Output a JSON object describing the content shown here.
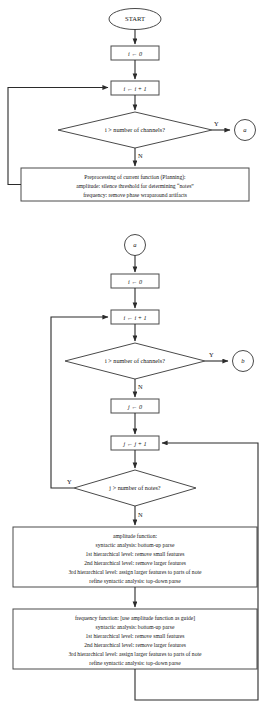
{
  "diagram": {
    "nodes": {
      "start": "START",
      "init_i": "i ← 0",
      "incr_i": "i ← i + 1",
      "decision_channels_1": "i > number of channels?",
      "connector_a_out": "a",
      "connector_a_in": "a",
      "preprocess": {
        "line1": "Preprocessing of current function (Planning):",
        "line2": "amplitude: silence threshold for determining “notes”",
        "line3": "frequency: remove phase wraparound artifacts"
      },
      "init_i2": "i ← 0",
      "incr_i2": "i ← i + 1",
      "decision_channels_2": "i > number of channels?",
      "connector_b": "b",
      "init_j": "j ← 0",
      "incr_j": "j ← j + 1",
      "decision_notes": "j > number of notes?",
      "amplitude_box": {
        "line1": "amplitude function:",
        "line2": "syntactic analysis: bottom-up parse",
        "line3": "1st hierarchical level: remove small features",
        "line4": "2nd hierarchical level: remove larger features",
        "line5": "3rd hierarchical level: assign larger features to parts of note",
        "line6": "refine syntactic analysis: top-down parse"
      },
      "frequency_box": {
        "line1": "frequency function: [use amplitude function as guide]",
        "line2": "syntactic analysis: bottom-up parse",
        "line3": "1st hierarchical level: remove small features",
        "line4": "2nd hierarchical level: remove larger features",
        "line5": "3rd hierarchical level: assign larger features to parts of note",
        "line6": "refine syntactic analysis: top-down parse"
      }
    },
    "edge_labels": {
      "yes_1": "Y",
      "no_1": "N",
      "yes_2": "Y",
      "no_2": "N",
      "yes_3": "Y",
      "no_3": "N"
    },
    "colors": {
      "stroke": "#4a4a4a",
      "edge": "#2b2b2b",
      "text": "#161616",
      "background": "#ffffff"
    }
  }
}
